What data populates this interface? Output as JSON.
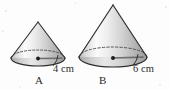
{
  "figure": {
    "background_color": "#fdfdfd",
    "ink_color": "#2b2b2b",
    "units": "cm",
    "shapes": [
      {
        "id": "cone-a",
        "name": "A",
        "label": "A",
        "dimension_label": "4 cm",
        "dimension_value": 4,
        "dimension_kind": "radius",
        "apex": {
          "x": 38,
          "y": 22
        },
        "base_center": {
          "x": 38,
          "y": 58
        },
        "base_rx": 27,
        "base_ry": 8,
        "height_px": 36
      },
      {
        "id": "cone-b",
        "name": "B",
        "label": "B",
        "dimension_label": "6 cm",
        "dimension_value": 6,
        "dimension_kind": "radius",
        "apex": {
          "x": 113,
          "y": 5
        },
        "base_center": {
          "x": 113,
          "y": 57
        },
        "base_rx": 34,
        "base_ry": 10,
        "height_px": 52
      }
    ]
  }
}
